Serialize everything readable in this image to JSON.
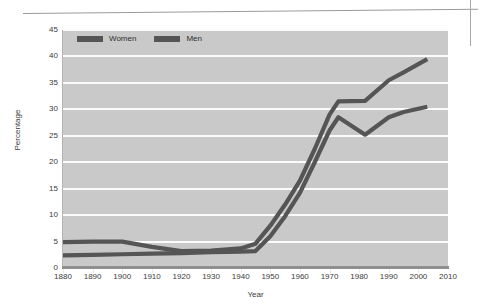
{
  "chart_data": {
    "type": "line",
    "title": "",
    "xlabel": "Year",
    "ylabel": "Percentage",
    "xlim": [
      1880,
      2010
    ],
    "ylim": [
      0,
      45
    ],
    "xticks": [
      1880,
      1890,
      1900,
      1910,
      1920,
      1930,
      1940,
      1950,
      1960,
      1970,
      1980,
      1990,
      2000,
      2010
    ],
    "yticks": [
      0,
      5,
      10,
      15,
      20,
      25,
      30,
      35,
      40,
      45
    ],
    "xtick_labels": [
      "1880",
      "1890",
      "1900",
      "1910",
      "1920",
      "1930",
      "1940",
      "1950",
      "1960",
      "1970",
      "1980",
      "1990",
      "2000",
      "2010"
    ],
    "ytick_labels": [
      "0",
      "5",
      "10",
      "15",
      "20",
      "25",
      "30",
      "35",
      "40",
      "45"
    ],
    "grid": "horizontal",
    "legend_position": "top-left-inside",
    "series": [
      {
        "name": "Women",
        "color": "#555555",
        "x": [
          1880,
          1890,
          1900,
          1910,
          1920,
          1930,
          1940,
          1945,
          1950,
          1955,
          1960,
          1965,
          1970,
          1973,
          1982,
          1990,
          1995,
          2003
        ],
        "values": [
          4.9,
          5.0,
          5.0,
          4.0,
          3.2,
          3.3,
          3.7,
          4.6,
          8.0,
          12.0,
          16.5,
          22.5,
          29.0,
          31.5,
          31.6,
          35.5,
          37.0,
          39.5
        ]
      },
      {
        "name": "Men",
        "color": "#555555",
        "x": [
          1880,
          1890,
          1900,
          1910,
          1920,
          1930,
          1940,
          1945,
          1950,
          1955,
          1960,
          1965,
          1970,
          1973,
          1982,
          1990,
          1995,
          2003
        ],
        "values": [
          2.4,
          2.5,
          2.6,
          2.7,
          2.8,
          3.0,
          3.1,
          3.2,
          6.0,
          9.8,
          14.2,
          20.0,
          26.0,
          28.5,
          25.2,
          28.5,
          29.5,
          30.5
        ]
      }
    ]
  },
  "legend": {
    "entries": [
      {
        "label": "Women"
      },
      {
        "label": "Men"
      }
    ]
  },
  "colors": {
    "plot_background": "#c9c9c9",
    "gridline": "#fbfbfb",
    "line": "#555555",
    "axis": "#8f8f8f",
    "text": "#3b3b3b"
  }
}
